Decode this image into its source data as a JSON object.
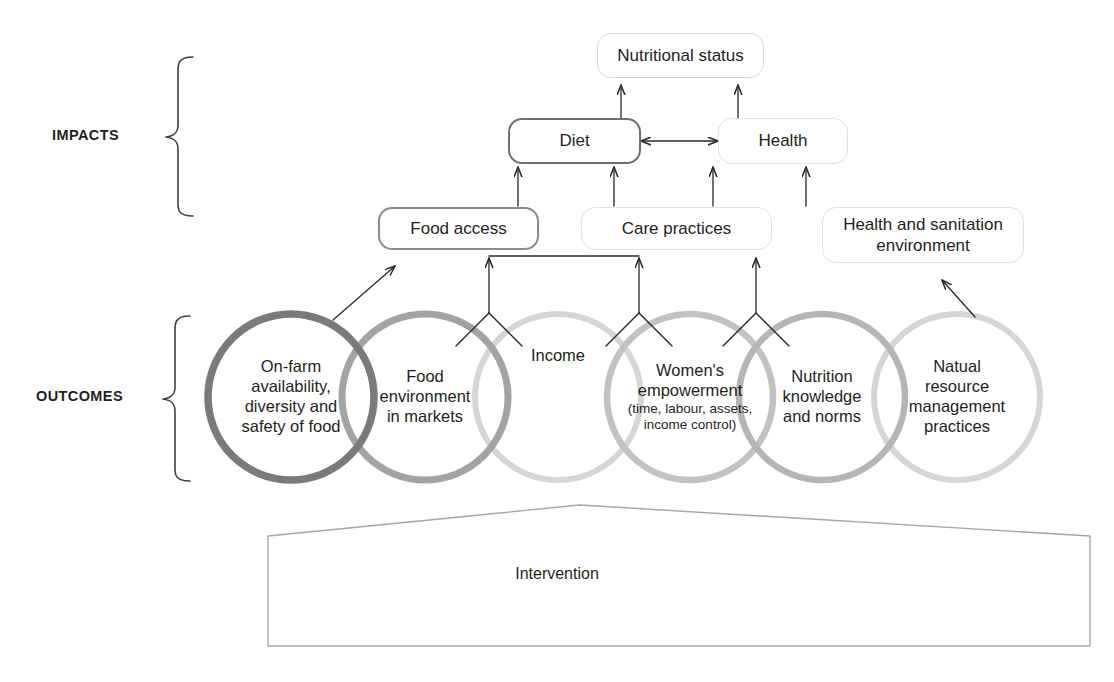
{
  "diagram": {
    "tiers": [
      {
        "id": "impacts",
        "label": "IMPACTS"
      },
      {
        "id": "outcomes",
        "label": "OUTCOMES"
      }
    ],
    "impact_nodes": [
      {
        "id": "nutritional-status",
        "label": "Nutritional status",
        "border_color": "#d9d9d9"
      },
      {
        "id": "diet",
        "label": "Diet",
        "border_color": "#6f6f6f"
      },
      {
        "id": "health",
        "label": "Health",
        "border_color": "#e2e2e2"
      }
    ],
    "intermediate_nodes": [
      {
        "id": "food-access",
        "label": "Food access",
        "border_color": "#8c8c8c"
      },
      {
        "id": "care-practices",
        "label": "Care practices",
        "border_color": "#e2e2e2"
      },
      {
        "id": "health-sanitation",
        "label": "Health and sanitation environment",
        "border_color": "#e2e2e2"
      }
    ],
    "outcome_circles": [
      {
        "id": "on-farm",
        "label": "On-farm availability, diversity and safety of food",
        "lines": [
          "On-farm",
          "availability,",
          "diversity and",
          "safety of food"
        ],
        "sub_lines": [],
        "border_color": "#7a7a7a"
      },
      {
        "id": "food-environment",
        "label": "Food environment in markets",
        "lines": [
          "Food",
          "environment",
          "in markets"
        ],
        "sub_lines": [],
        "border_color": "#a3a3a3"
      },
      {
        "id": "income",
        "label": "Income",
        "lines": [
          "Income"
        ],
        "sub_lines": [],
        "border_color": "#d6d6d6"
      },
      {
        "id": "womens-empowerment",
        "label": "Women's empowerment (time, labour, assets, income control)",
        "lines": [
          "Women's",
          "empowerment"
        ],
        "sub_lines": [
          "(time, labour, assets,",
          "income control)"
        ],
        "border_color": "#c2c2c2"
      },
      {
        "id": "nutrition-knowledge",
        "label": "Nutrition knowledge and norms",
        "lines": [
          "Nutrition",
          "knowledge",
          "and norms"
        ],
        "sub_lines": [],
        "border_color": "#b5b5b5"
      },
      {
        "id": "natural-resource",
        "label": "Natual resource management practices",
        "lines": [
          "Natual",
          "resource",
          "management",
          "practices"
        ],
        "sub_lines": [],
        "border_color": "#d6d6d6"
      }
    ],
    "foundation": {
      "id": "intervention",
      "label": "Intervention",
      "border_color": "#a6a6a6"
    },
    "connectors": [
      {
        "id": "diet-to-nutritional-status",
        "type": "arrow-up",
        "from": "diet",
        "to": "nutritional-status"
      },
      {
        "id": "health-to-nutritional-status",
        "type": "arrow-up",
        "from": "health",
        "to": "nutritional-status"
      },
      {
        "id": "diet-health-bidirectional",
        "type": "double-arrow",
        "from": "diet",
        "to": "health"
      },
      {
        "id": "food-access-to-diet",
        "type": "arrow-up",
        "from": "food-access",
        "to": "diet"
      },
      {
        "id": "care-practices-to-diet",
        "type": "arrow-up",
        "from": "care-practices",
        "to": "diet"
      },
      {
        "id": "care-practices-to-health",
        "type": "arrow-up",
        "from": "care-practices",
        "to": "health"
      },
      {
        "id": "health-sanitation-to-health",
        "type": "arrow-up",
        "from": "health-sanitation",
        "to": "health"
      },
      {
        "id": "on-farm-to-food-access",
        "type": "diagonal-arrow",
        "from": "on-farm",
        "to": "food-access"
      },
      {
        "id": "income-merge-to-food-access",
        "type": "y-merge",
        "from": "food-environment+income",
        "to": "food-access"
      },
      {
        "id": "income-merge-to-care-practices",
        "type": "y-merge",
        "from": "income+womens-empowerment",
        "to": "care-practices"
      },
      {
        "id": "empowerment-merge-to-care-practices",
        "type": "y-merge",
        "from": "womens-empowerment+nutrition-knowledge",
        "to": "care-practices"
      },
      {
        "id": "natural-resource-to-health-sanitation",
        "type": "diagonal-arrow",
        "from": "natural-resource",
        "to": "health-sanitation"
      }
    ],
    "colors": {
      "ink": "#231f20",
      "stroke_dark": "#4a4a4a",
      "stroke_mid": "#8c8c8c",
      "stroke_light": "#d6d6d6",
      "background": "#ffffff"
    }
  }
}
